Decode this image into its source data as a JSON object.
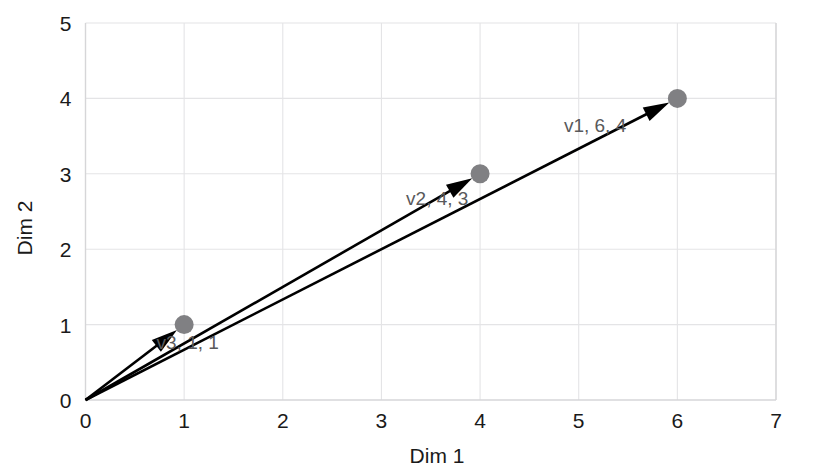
{
  "chart_data": {
    "type": "scatter",
    "title": "",
    "subtitle": "",
    "xlabel": "Dim 1",
    "ylabel": "Dim 2",
    "xlim": [
      0,
      7
    ],
    "ylim": [
      0,
      5
    ],
    "xticks": [
      "0",
      "1",
      "2",
      "3",
      "4",
      "5",
      "6",
      "7"
    ],
    "yticks": [
      "0",
      "1",
      "2",
      "3",
      "4",
      "5"
    ],
    "grid": true,
    "legend": "none",
    "annotations": [
      "v1, 6, 4",
      "v2, 4, 3",
      "v3, 1, 1"
    ],
    "series": [
      {
        "name": "v1",
        "label": "v1, 6, 4",
        "x": 6,
        "y": 4,
        "origin_x": 0,
        "origin_y": 0,
        "label_x": 4.85,
        "label_y": 3.55
      },
      {
        "name": "v2",
        "label": "v2, 4, 3",
        "x": 4,
        "y": 3,
        "origin_x": 0,
        "origin_y": 0,
        "label_x": 3.25,
        "label_y": 2.58
      },
      {
        "name": "v3",
        "label": "v3, 1, 1",
        "x": 1,
        "y": 1,
        "origin_x": 0,
        "origin_y": 0,
        "label_x": 0.72,
        "label_y": 0.67
      }
    ],
    "colors": {
      "point": "#808083",
      "arrow": "#000000",
      "grid": "#e4e4e6",
      "axis": "#d6d6d8",
      "tick_text": "#1a1a1a",
      "label_text": "#59595b",
      "background": "#ffffff"
    }
  }
}
